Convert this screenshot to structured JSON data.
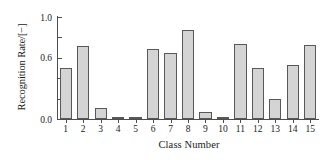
{
  "chart_data": {
    "type": "bar",
    "title": "",
    "xlabel": "Class Number",
    "ylabel": "Recognition Rate/[−]",
    "categories": [
      "1",
      "2",
      "3",
      "4",
      "5",
      "6",
      "7",
      "8",
      "9",
      "10",
      "11",
      "12",
      "13",
      "14",
      "15"
    ],
    "values": [
      0.5,
      0.72,
      0.11,
      0.02,
      0.005,
      0.69,
      0.65,
      0.87,
      0.07,
      0.01,
      0.74,
      0.5,
      0.2,
      0.53,
      0.73
    ],
    "ylim": [
      0.0,
      1.0
    ],
    "xlim_categories": 15,
    "y_major_ticks": [
      0.0,
      0.6,
      1.0
    ],
    "y_minor_ticks": [
      0.2,
      0.4,
      0.8
    ],
    "y_tick_labels": {
      "0": "0.0",
      "0.6": "0.6",
      "1": "1.0"
    },
    "grid": false,
    "legend": null,
    "bar_fill_color": "#d4d4d4",
    "bar_edge_color": "#585858",
    "axis_color": "#4d4d4d"
  },
  "axes": {
    "y_title": "Recognition Rate/[−]",
    "x_title": "Class Number",
    "y_labels": [
      "1.0",
      "0.6",
      "0.0"
    ],
    "x_labels": [
      "1",
      "2",
      "3",
      "4",
      "5",
      "6",
      "7",
      "8",
      "9",
      "10",
      "11",
      "12",
      "13",
      "14",
      "15"
    ]
  }
}
